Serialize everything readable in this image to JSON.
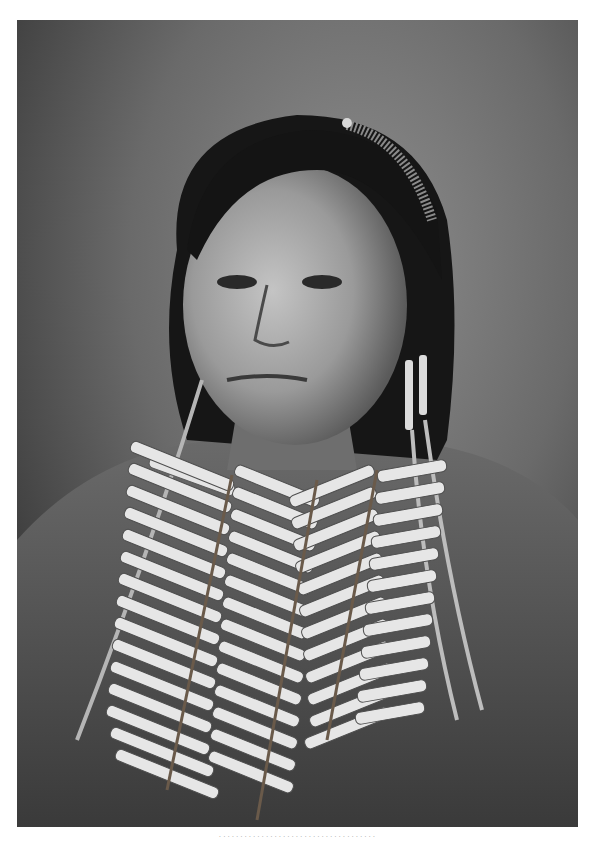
{
  "image": {
    "subject": "Black-and-white studio portrait of a Native American woman wearing a hairpipe bone breastplate and long twisted-cord earrings",
    "palette": {
      "background_light": "#8a8a8a",
      "background_dark": "#2a2a2a",
      "hair": "#141414",
      "skin": "#9c9c9c",
      "skin_highlight": "#c8c8c8",
      "garment": "#5a5a5a",
      "bone": "#e6e6e6"
    }
  },
  "caption": {
    "text": "· · · · · · · · · · · · · · · · · · · · · · · · · · · · · · · · · · · · ·"
  }
}
